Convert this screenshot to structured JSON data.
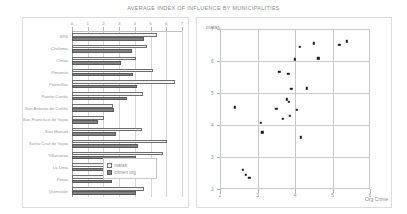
{
  "title": "AVERAGE INDEX OF INFLUENCE BY MUNICIPALITIES",
  "legend": {
    "maras_label": "maras",
    "crimen_label": "crimen org"
  },
  "scatter_labels": {
    "y_label": "maras",
    "x_label": "Org Crime"
  },
  "chart_data": [
    {
      "type": "bar",
      "title": "AVERAGE INDEX OF INFLUENCE BY MUNICIPALITIES",
      "orientation": "horizontal",
      "xlabel": "",
      "ylabel": "",
      "xlim": [
        0,
        7
      ],
      "xticks": [
        0,
        1,
        2,
        3,
        4,
        5,
        6,
        7
      ],
      "grid": true,
      "legend_position": "inside-bottom-right",
      "categories": [
        "SPS",
        "Choloma",
        "Omoa",
        "Pimienta",
        "Potrerillos",
        "Puerto Cortés",
        "San Antonio de Cortés",
        "San Francisco de Yojoa",
        "San Manuel",
        "Santa Cruz de Yojoa",
        "Villanueva",
        "La Lima",
        "Petoa",
        "Quimistán"
      ],
      "series": [
        {
          "name": "maras",
          "color": "#f2f2f2",
          "values": [
            5.4,
            4.8,
            4.1,
            5.15,
            6.55,
            4.5,
            2.6,
            2.05,
            4.45,
            6.05,
            5.8,
            4.7,
            2.35,
            4.55
          ]
        },
        {
          "name": "crimen org",
          "color": "#808080",
          "values": [
            4.6,
            3.8,
            3.1,
            3.9,
            4.15,
            3.5,
            2.65,
            1.65,
            2.8,
            4.2,
            4.05,
            4.25,
            2.55,
            4.05
          ]
        }
      ]
    },
    {
      "type": "scatter",
      "xlabel": "Org Crime",
      "ylabel": "maras",
      "xlim": [
        2,
        6
      ],
      "ylim": [
        2,
        7
      ],
      "xticks": [
        2,
        3,
        4,
        5,
        6
      ],
      "yticks": [
        2,
        3,
        4,
        5,
        6,
        7
      ],
      "grid": true,
      "marker_color": "#1b1b1b",
      "points": [
        {
          "x": 2.4,
          "y": 4.55
        },
        {
          "x": 2.6,
          "y": 2.6
        },
        {
          "x": 2.68,
          "y": 2.45
        },
        {
          "x": 2.78,
          "y": 2.35
        },
        {
          "x": 3.08,
          "y": 4.07
        },
        {
          "x": 3.13,
          "y": 3.77
        },
        {
          "x": 3.5,
          "y": 4.5
        },
        {
          "x": 3.58,
          "y": 5.66
        },
        {
          "x": 3.68,
          "y": 4.2
        },
        {
          "x": 3.78,
          "y": 4.8
        },
        {
          "x": 3.82,
          "y": 5.6
        },
        {
          "x": 3.83,
          "y": 4.72
        },
        {
          "x": 3.86,
          "y": 4.28
        },
        {
          "x": 3.9,
          "y": 5.13
        },
        {
          "x": 4.0,
          "y": 6.05
        },
        {
          "x": 4.05,
          "y": 4.47
        },
        {
          "x": 4.12,
          "y": 6.45
        },
        {
          "x": 4.15,
          "y": 3.62
        },
        {
          "x": 4.32,
          "y": 5.15
        },
        {
          "x": 4.5,
          "y": 6.55
        },
        {
          "x": 4.62,
          "y": 6.08
        },
        {
          "x": 5.18,
          "y": 6.5
        },
        {
          "x": 5.38,
          "y": 6.62
        }
      ]
    }
  ]
}
